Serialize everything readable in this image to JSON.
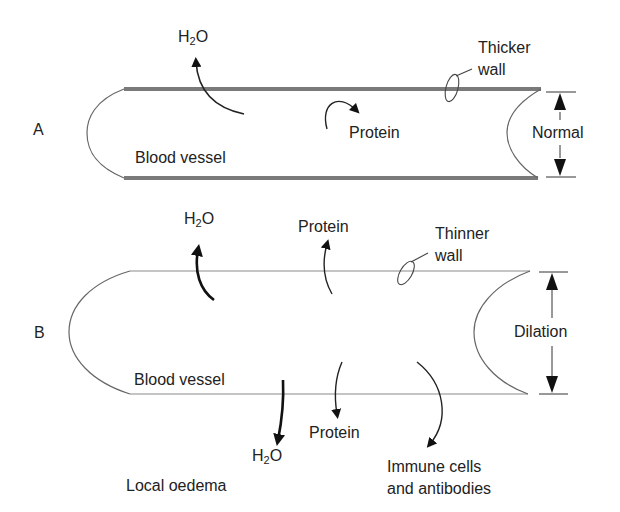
{
  "colors": {
    "thick_wall": "#7a7a7a",
    "thin_wall": "#8a8a8a",
    "line": "#555555",
    "arrow": "#111111",
    "text": "#222222"
  },
  "panel_a": {
    "label": "A",
    "vessel_label": "Blood vessel",
    "h2o": {
      "prefix": "H",
      "sub": "2",
      "suffix": "O"
    },
    "protein_label": "Protein",
    "wall_label_line1": "Thicker",
    "wall_label_line2": "wall",
    "dimension_label": "Normal"
  },
  "panel_b": {
    "label": "B",
    "vessel_label": "Blood vessel",
    "h2o_out_top": {
      "prefix": "H",
      "sub": "2",
      "suffix": "O"
    },
    "protein_top_label": "Protein",
    "wall_label_line1": "Thinner",
    "wall_label_line2": "wall",
    "dimension_label": "Dilation",
    "h2o_out_bottom": {
      "prefix": "H",
      "sub": "2",
      "suffix": "O"
    },
    "protein_bottom_label": "Protein",
    "immune_label_line1": "Immune cells",
    "immune_label_line2": "and antibodies",
    "oedema_label": "Local oedema"
  }
}
